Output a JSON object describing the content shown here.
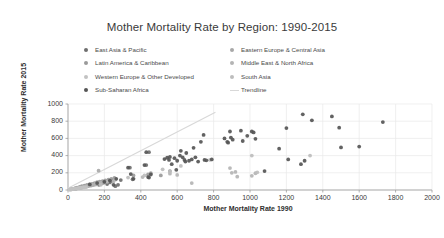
{
  "chart_data": {
    "type": "scatter",
    "title": "Mother Mortality Rate by Region: 1990-2015",
    "xlabel": "Mother Mortality Rate 1990",
    "ylabel": "Mother Mortality Rate 2015",
    "xlim": [
      0,
      2000
    ],
    "ylim": [
      0,
      1000
    ],
    "xticks": [
      0,
      200,
      400,
      600,
      800,
      1000,
      1200,
      1400,
      1600,
      1800,
      2000
    ],
    "yticks": [
      0,
      200,
      400,
      600,
      800,
      1000
    ],
    "grid": true,
    "legend_position": "top",
    "series": [
      {
        "name": "East Asia & Pacific",
        "color": "#6e6e6e",
        "points": [
          [
            30,
            12
          ],
          [
            42,
            18
          ],
          [
            55,
            25
          ],
          [
            68,
            30
          ],
          [
            80,
            35
          ],
          [
            95,
            45
          ],
          [
            110,
            52
          ],
          [
            125,
            58
          ],
          [
            140,
            66
          ],
          [
            155,
            74
          ],
          [
            170,
            60
          ],
          [
            185,
            78
          ],
          [
            200,
            92
          ],
          [
            215,
            70
          ],
          [
            230,
            88
          ],
          [
            245,
            105
          ],
          [
            260,
            45
          ],
          [
            275,
            60
          ],
          [
            290,
            115
          ],
          [
            340,
            260
          ],
          [
            355,
            125
          ],
          [
            430,
            290
          ],
          [
            445,
            440
          ]
        ]
      },
      {
        "name": "Eastern Europe & Central Asia",
        "color": "#a8a8a8",
        "points": [
          [
            18,
            8
          ],
          [
            26,
            11
          ],
          [
            34,
            14
          ],
          [
            44,
            17
          ],
          [
            52,
            21
          ],
          [
            60,
            24
          ],
          [
            70,
            28
          ],
          [
            78,
            31
          ],
          [
            88,
            36
          ],
          [
            98,
            40
          ],
          [
            108,
            44
          ],
          [
            118,
            48
          ],
          [
            128,
            52
          ],
          [
            138,
            57
          ],
          [
            148,
            62
          ],
          [
            158,
            66
          ],
          [
            168,
            225
          ],
          [
            178,
            72
          ],
          [
            188,
            78
          ],
          [
            198,
            84
          ]
        ]
      },
      {
        "name": "Latin America & Caribbean",
        "color": "#9a9a9a",
        "points": [
          [
            22,
            10
          ],
          [
            38,
            20
          ],
          [
            50,
            28
          ],
          [
            64,
            36
          ],
          [
            76,
            44
          ],
          [
            90,
            50
          ],
          [
            104,
            58
          ],
          [
            118,
            64
          ],
          [
            132,
            70
          ],
          [
            146,
            80
          ],
          [
            160,
            90
          ],
          [
            174,
            96
          ],
          [
            190,
            104
          ],
          [
            205,
            112
          ],
          [
            222,
            120
          ],
          [
            238,
            130
          ],
          [
            255,
            140
          ],
          [
            360,
            170
          ],
          [
            440,
            180
          ],
          [
            455,
            195
          ],
          [
            510,
            170
          ],
          [
            560,
            220
          ]
        ]
      },
      {
        "name": "Middle East & North Africa",
        "color": "#b4b4b4",
        "points": [
          [
            40,
            15
          ],
          [
            58,
            22
          ],
          [
            72,
            30
          ],
          [
            86,
            38
          ],
          [
            100,
            46
          ],
          [
            116,
            54
          ],
          [
            132,
            62
          ],
          [
            150,
            70
          ],
          [
            166,
            78
          ],
          [
            182,
            86
          ],
          [
            250,
            100
          ],
          [
            410,
            150
          ],
          [
            560,
            190
          ],
          [
            600,
            175
          ],
          [
            680,
            80
          ],
          [
            890,
            255
          ],
          [
            900,
            200
          ],
          [
            920,
            210
          ],
          [
            930,
            155
          ],
          [
            1010,
            165
          ],
          [
            1030,
            195
          ]
        ]
      },
      {
        "name": "Western Europe & Other Developed",
        "color": "#c2c2c2",
        "points": [
          [
            8,
            4
          ],
          [
            12,
            6
          ],
          [
            16,
            7
          ],
          [
            20,
            9
          ],
          [
            24,
            10
          ],
          [
            28,
            12
          ],
          [
            32,
            13
          ],
          [
            36,
            15
          ],
          [
            40,
            16
          ],
          [
            46,
            18
          ],
          [
            52,
            20
          ],
          [
            58,
            22
          ],
          [
            64,
            24
          ],
          [
            70,
            26
          ],
          [
            80,
            28
          ],
          [
            90,
            30
          ],
          [
            100,
            33
          ]
        ]
      },
      {
        "name": "South Asia",
        "color": "#bdbdbd",
        "points": [
          [
            180,
            60
          ],
          [
            215,
            95
          ],
          [
            260,
            120
          ],
          [
            330,
            145
          ],
          [
            420,
            170
          ],
          [
            520,
            240
          ],
          [
            560,
            215
          ],
          [
            620,
            280
          ],
          [
            780,
            350
          ],
          [
            1010,
            400
          ],
          [
            1040,
            205
          ],
          [
            1330,
            400
          ]
        ]
      },
      {
        "name": "Sub-Saharan Africa",
        "color": "#555555",
        "points": [
          [
            120,
            65
          ],
          [
            160,
            80
          ],
          [
            200,
            95
          ],
          [
            230,
            110
          ],
          [
            250,
            60
          ],
          [
            265,
            130
          ],
          [
            330,
            260
          ],
          [
            345,
            185
          ],
          [
            360,
            130
          ],
          [
            420,
            290
          ],
          [
            430,
            440
          ],
          [
            440,
            150
          ],
          [
            445,
            145
          ],
          [
            455,
            180
          ],
          [
            530,
            360
          ],
          [
            545,
            375
          ],
          [
            555,
            350
          ],
          [
            560,
            385
          ],
          [
            570,
            300
          ],
          [
            585,
            370
          ],
          [
            595,
            235
          ],
          [
            600,
            340
          ],
          [
            615,
            400
          ],
          [
            620,
            455
          ],
          [
            630,
            380
          ],
          [
            640,
            350
          ],
          [
            645,
            330
          ],
          [
            650,
            430
          ],
          [
            665,
            340
          ],
          [
            680,
            355
          ],
          [
            690,
            490
          ],
          [
            700,
            380
          ],
          [
            715,
            330
          ],
          [
            730,
            560
          ],
          [
            745,
            640
          ],
          [
            750,
            350
          ],
          [
            760,
            345
          ],
          [
            790,
            355
          ],
          [
            860,
            600
          ],
          [
            875,
            560
          ],
          [
            880,
            550
          ],
          [
            890,
            680
          ],
          [
            895,
            610
          ],
          [
            905,
            585
          ],
          [
            950,
            690
          ],
          [
            960,
            570
          ],
          [
            985,
            630
          ],
          [
            1010,
            680
          ],
          [
            1020,
            670
          ],
          [
            1030,
            595
          ],
          [
            1080,
            220
          ],
          [
            1160,
            480
          ],
          [
            1200,
            720
          ],
          [
            1210,
            355
          ],
          [
            1280,
            300
          ],
          [
            1290,
            880
          ],
          [
            1300,
            340
          ],
          [
            1340,
            810
          ],
          [
            1450,
            855
          ],
          [
            1490,
            725
          ],
          [
            1500,
            495
          ],
          [
            1600,
            505
          ],
          [
            1730,
            790
          ]
        ]
      }
    ],
    "trendline": {
      "name": "Trendline",
      "color": "#d8d8d8",
      "x_start": 0,
      "y_start": 20,
      "x_end": 810,
      "y_end": 905
    }
  },
  "legend": {
    "items": [
      {
        "label": "East Asia & Pacific",
        "marker": "circle",
        "color": "#6e6e6e"
      },
      {
        "label": "Eastern Europe & Central Asia",
        "marker": "circle",
        "color": "#a8a8a8"
      },
      {
        "label": "Latin America & Caribbean",
        "marker": "circle",
        "color": "#9a9a9a"
      },
      {
        "label": "Middle East & North Africa",
        "marker": "circle",
        "color": "#b4b4b4"
      },
      {
        "label": "Western Europe & Other Developed",
        "marker": "circle",
        "color": "#c2c2c2"
      },
      {
        "label": "South Asia",
        "marker": "circle",
        "color": "#bdbdbd"
      },
      {
        "label": "Sub-Saharan Africa",
        "marker": "circle",
        "color": "#555555"
      },
      {
        "label": "Trendline",
        "marker": "line",
        "color": "#d8d8d8"
      }
    ]
  }
}
